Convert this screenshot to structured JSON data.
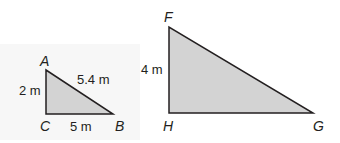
{
  "diagram": {
    "triangle_abc": {
      "vertices": {
        "A": "A",
        "B": "B",
        "C": "C"
      },
      "sides": {
        "AC": "2 m",
        "CB": "5 m",
        "AB": "5.4 m"
      },
      "fill": "#d3d3d3",
      "stroke": "#231f20"
    },
    "triangle_fgh": {
      "vertices": {
        "F": "F",
        "G": "G",
        "H": "H"
      },
      "sides": {
        "FH": "4 m"
      },
      "fill": "#d3d3d3",
      "stroke": "#231f20"
    }
  }
}
